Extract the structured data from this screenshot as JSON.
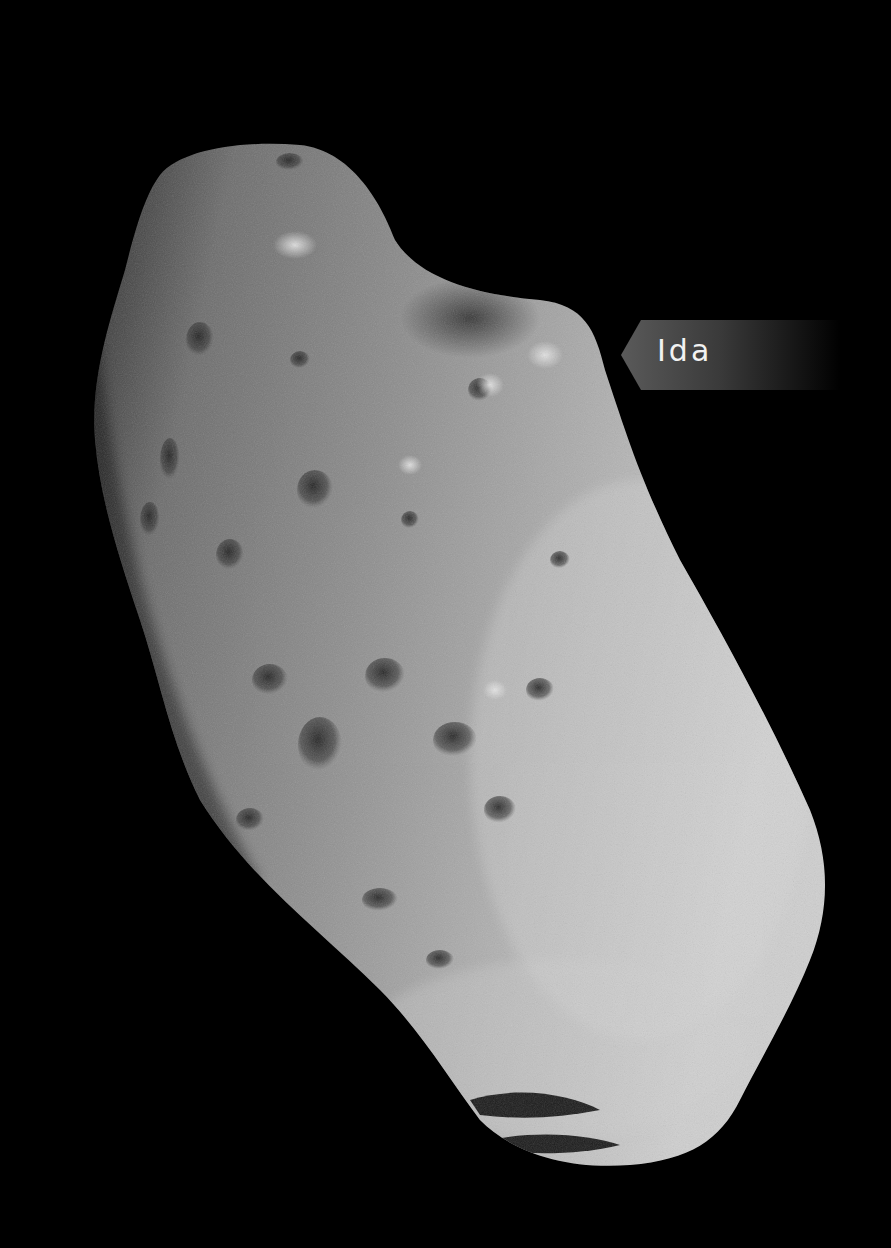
{
  "image": {
    "subject": "Asteroid Ida",
    "background_color": "#000000"
  },
  "label": {
    "text": "Ida",
    "text_color": "#f2f2f2",
    "bg_color_start": "#5a5a5a",
    "bg_color_end": "#000000",
    "pointer_direction": "left"
  }
}
